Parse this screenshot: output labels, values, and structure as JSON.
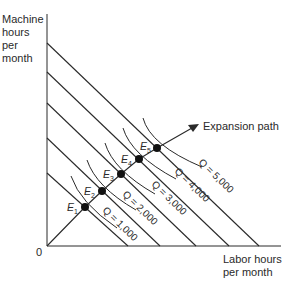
{
  "diagram": {
    "title": "",
    "y_axis_label": [
      "Machine",
      "hours",
      "per",
      "month"
    ],
    "x_axis_label": [
      "Labor hours",
      "per month"
    ],
    "origin_label": "0",
    "expansion_path_label": "Expansion path",
    "equilibria": [
      {
        "letter": "E",
        "sub": "1"
      },
      {
        "letter": "E",
        "sub": "2"
      },
      {
        "letter": "E",
        "sub": "3"
      },
      {
        "letter": "E",
        "sub": "4"
      },
      {
        "letter": "E",
        "sub": "5"
      }
    ],
    "isoquants": [
      {
        "label": "Q = 1,000"
      },
      {
        "label": "Q = 2,000"
      },
      {
        "label": "Q = 3,000"
      },
      {
        "label": "Q = 4,000"
      },
      {
        "label": "Q = 5,000"
      }
    ],
    "isocost_count": 5,
    "colors": {
      "line": "#2a2a2a",
      "point": "#111111",
      "background": "#ffffff"
    }
  }
}
